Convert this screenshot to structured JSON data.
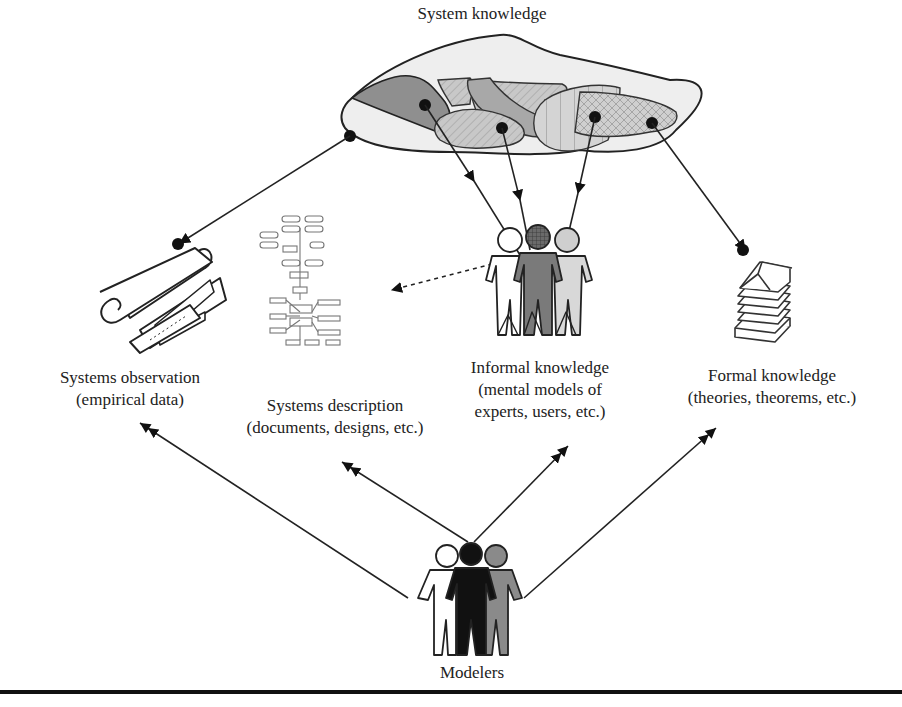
{
  "title": "System knowledge",
  "nodes": {
    "observation": {
      "line1": "Systems observation",
      "line2": "(empirical data)"
    },
    "description": {
      "line1": "Systems description",
      "line2": "(documents, designs, etc.)"
    },
    "informal": {
      "line1": "Informal knowledge",
      "line2": "(mental models of",
      "line3": "experts, users, etc.)"
    },
    "formal": {
      "line1": "Formal knowledge",
      "line2": "(theories, theorems, etc.)"
    },
    "modelers": {
      "label": "Modelers"
    }
  },
  "icons": {
    "observation": "rolled-paper-ruler-icon",
    "description": "flowchart-document-icon",
    "informal": "group-of-people-icon",
    "formal": "stack-of-books-icon",
    "modelers": "group-of-people-icon"
  },
  "colors": {
    "line": "#222222",
    "cloud_fill": "#ececec",
    "region_dark": "#8c8c8c",
    "region_mid": "#bdbdbd",
    "region_light": "#d6d6d6",
    "person_black": "#111111",
    "person_gray": "#8a8a8a"
  }
}
